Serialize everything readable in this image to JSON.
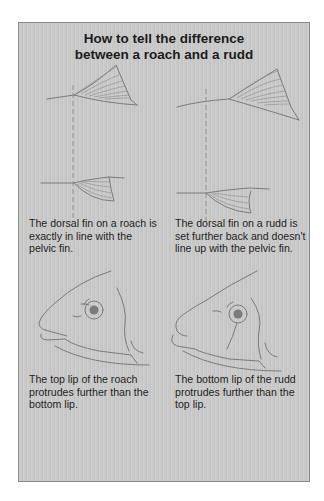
{
  "title": {
    "line1": "How to tell the difference",
    "line2": "between a roach and a rudd"
  },
  "sections": [
    {
      "topic": "dorsal-fin-position",
      "roach": {
        "caption": "The dorsal fin on a roach is exactly in line with the pelvic fin."
      },
      "rudd": {
        "caption": "The dorsal fin on a rudd is set further back and doesn't line up with the pelvic fin."
      }
    },
    {
      "topic": "lip-position",
      "roach": {
        "caption": "The top lip of the roach protrudes further than the bottom lip."
      },
      "rudd": {
        "caption": "The bottom lip of the rudd protrudes further than the top lip."
      }
    }
  ],
  "colors": {
    "panel_fill": "#c9c9c9",
    "panel_border": "#8c8c8c",
    "text": "#1c1c1c",
    "line_art": "#7b7b7b"
  }
}
